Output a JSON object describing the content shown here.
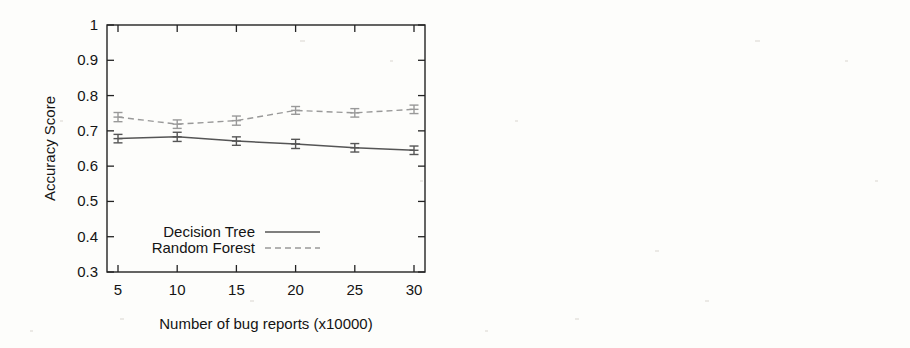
{
  "chart_data": [
    {
      "id": "left",
      "type": "line",
      "title": "",
      "xlabel": "Number of bug reports (x10000)",
      "ylabel": "Accuracy Score",
      "categories": [
        5,
        10,
        15,
        20,
        25,
        30
      ],
      "xtick_labels": [
        "5",
        "10",
        "15",
        "20",
        "25",
        "30"
      ],
      "ytick_labels": [
        "0.3",
        "0.4",
        "0.5",
        "0.6",
        "0.7",
        "0.8",
        "0.9",
        "1"
      ],
      "ytick_values": [
        0.3,
        0.4,
        0.5,
        0.6,
        0.7,
        0.8,
        0.9,
        1.0
      ],
      "xlim": [
        5,
        30
      ],
      "ylim": [
        0.3,
        1.0
      ],
      "grid": false,
      "legend_position": "bottom-left",
      "series": [
        {
          "name": "Decision Tree",
          "style": "solid",
          "color": "#555555",
          "values": [
            0.678,
            0.683,
            0.671,
            0.663,
            0.652,
            0.645
          ],
          "errors": [
            0.012,
            0.013,
            0.012,
            0.013,
            0.012,
            0.012
          ]
        },
        {
          "name": "Random Forest",
          "style": "dashed",
          "color": "#999999",
          "values": [
            0.739,
            0.719,
            0.729,
            0.758,
            0.751,
            0.761
          ],
          "errors": [
            0.013,
            0.012,
            0.013,
            0.011,
            0.012,
            0.012
          ]
        }
      ]
    },
    {
      "id": "right",
      "type": "line",
      "title": "",
      "xlabel": "Number of bug reports (x10000)",
      "ylabel": "Accuracy Score",
      "categories": [
        5,
        10,
        15,
        20,
        25,
        30
      ],
      "xtick_labels": [
        "5",
        "10",
        "15",
        "20",
        "25",
        "30"
      ],
      "ytick_labels": [
        "0.3",
        "0.4",
        "0.5",
        "0.6",
        "0.7",
        "0.8",
        "0.9",
        "1"
      ],
      "ytick_values": [
        0.3,
        0.4,
        0.5,
        0.6,
        0.7,
        0.8,
        0.9,
        1.0
      ],
      "xlim": [
        5,
        30
      ],
      "ylim": [
        0.3,
        1.0
      ],
      "grid": false,
      "legend_position": "bottom-left",
      "series": [
        {
          "name": "Decision Tree",
          "style": "solid",
          "color": "#555555",
          "values": [
            0.699,
            0.7,
            0.69,
            0.68,
            0.67,
            0.671
          ],
          "errors": [
            0.011,
            0.011,
            0.011,
            0.01,
            0.01,
            0.01
          ]
        },
        {
          "name": "Random Forest",
          "style": "dashed",
          "color": "#999999",
          "values": [
            0.809,
            0.8,
            0.78,
            0.79,
            0.801,
            0.811
          ],
          "errors": [
            0.011,
            0.011,
            0.012,
            0.011,
            0.011,
            0.012
          ]
        }
      ]
    }
  ],
  "figures": {
    "left": {
      "ylabel": "Accuracy Score",
      "xlabel": "Number of bug reports (x10000)",
      "legend": {
        "decision_tree": "Decision Tree",
        "random_forest": "Random Forest"
      }
    },
    "right": {
      "ylabel": "Accuracy Score",
      "xlabel": "Number of bug reports (x10000)",
      "legend": {
        "decision_tree": "Decision Tree",
        "random_forest": "Random Forest"
      }
    }
  }
}
